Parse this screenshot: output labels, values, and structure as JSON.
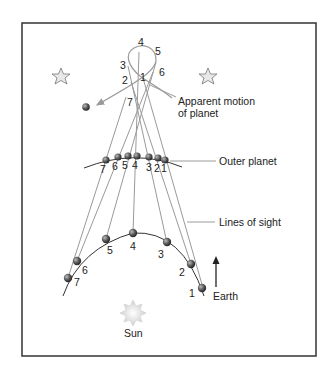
{
  "labels": {
    "apparent_motion_line1": "Apparent motion",
    "apparent_motion_line2": "of planet",
    "outer_planet": "Outer planet",
    "lines_of_sight": "Lines of sight",
    "earth": "Earth",
    "sun": "Sun"
  },
  "apparent_positions": [
    "1",
    "2",
    "3",
    "4",
    "5",
    "6",
    "7"
  ],
  "outer_planet_positions": [
    "1",
    "2",
    "3",
    "4",
    "5",
    "6",
    "7"
  ],
  "earth_positions": [
    "1",
    "2",
    "3",
    "4",
    "5",
    "6",
    "7"
  ],
  "colors": {
    "frame": "#333333",
    "sight_line": "#9a9a9a",
    "orbit": "#333333",
    "planet": "#555555",
    "star_fill": "#e8e8e8",
    "sun": "#e2e2e2"
  }
}
